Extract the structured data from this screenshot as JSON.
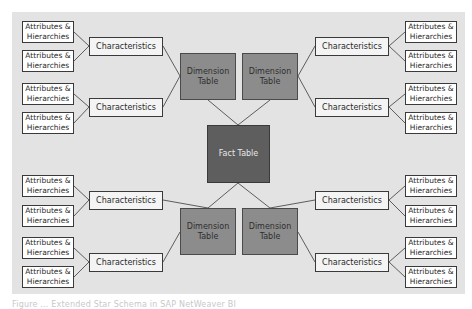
{
  "diagram": {
    "type": "extended-star-schema",
    "fact_table": {
      "label": "Fact Table"
    },
    "dimension_tables": [
      {
        "id": "dim-top-left",
        "label": "Dimension\nTable"
      },
      {
        "id": "dim-top-right",
        "label": "Dimension\nTable"
      },
      {
        "id": "dim-bottom-left",
        "label": "Dimension\nTable"
      },
      {
        "id": "dim-bottom-right",
        "label": "Dimension\nTable"
      }
    ],
    "characteristics_label": "Characteristics",
    "attributes_label_line1": "Attributes &",
    "attributes_label_line2": "Hierarchies",
    "colors": {
      "panel_background": "#e3e3e3",
      "fact_fill": "#5e5e5e",
      "dimension_fill": "#8c8c8c",
      "characteristics_fill": "#f4f4f4",
      "attributes_fill": "#ffffff",
      "line": "#3a3a3a"
    }
  },
  "caption": "Figure ... Extended Star Schema in SAP NetWeaver BI"
}
